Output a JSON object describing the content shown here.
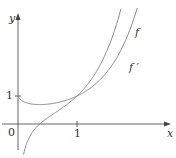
{
  "chart_data": {
    "type": "line",
    "title": "",
    "xlabel": "x",
    "ylabel": "y",
    "x_ticks": [
      "0",
      "1"
    ],
    "y_ticks": [
      "1"
    ],
    "xlim": [
      -0.3,
      2.55
    ],
    "ylim": [
      -0.45,
      3.9
    ],
    "grid": false,
    "series": [
      {
        "name": "f",
        "function": "x^x",
        "x": [
          0.02,
          0.1,
          0.2,
          0.37,
          0.5,
          0.75,
          1.0,
          1.25,
          1.5,
          1.75,
          2.0,
          2.3
        ],
        "values": [
          0.92,
          0.79,
          0.72,
          0.69,
          0.71,
          0.81,
          1.0,
          1.32,
          1.84,
          2.66,
          4.0,
          6.8
        ]
      },
      {
        "name": "f'",
        "function": "x^x(ln x + 1)",
        "x": [
          0.06,
          0.1,
          0.2,
          0.37,
          0.5,
          0.75,
          1.0,
          1.25,
          1.5,
          1.75,
          2.0
        ],
        "values": [
          -1.72,
          -1.03,
          -0.44,
          0.0,
          0.22,
          0.58,
          1.0,
          1.61,
          2.59,
          4.15,
          6.77
        ]
      }
    ],
    "annotations": [
      {
        "text": "f",
        "near_series": "f"
      },
      {
        "text": "f'",
        "near_series": "f'"
      }
    ]
  },
  "labels": {
    "y_axis": "y",
    "x_axis": "x",
    "origin": "0",
    "x_tick_1": "1",
    "y_tick_1": "1",
    "curve_f": "f",
    "curve_fprime": "f ′"
  },
  "colors": {
    "axis": "#555555",
    "curve": "#777777",
    "text": "#333333"
  }
}
